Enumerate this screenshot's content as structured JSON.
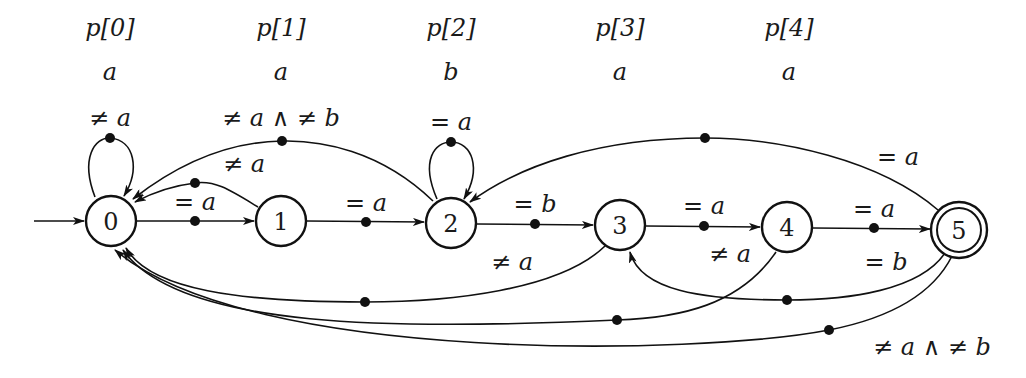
{
  "diagram": {
    "type": "finite-automaton (KMP pattern matcher)",
    "pattern_headers": [
      {
        "index_label": "p[0]",
        "char": "a",
        "x": 110
      },
      {
        "index_label": "p[1]",
        "char": "a",
        "x": 281
      },
      {
        "index_label": "p[2]",
        "char": "b",
        "x": 451
      },
      {
        "index_label": "p[3]",
        "char": "a",
        "x": 620
      },
      {
        "index_label": "p[4]",
        "char": "a",
        "x": 789
      }
    ],
    "states": [
      {
        "id": "0",
        "label": "0",
        "x": 111,
        "y": 221,
        "initial": true,
        "accepting": false
      },
      {
        "id": "1",
        "label": "1",
        "x": 281,
        "y": 221,
        "initial": false,
        "accepting": false
      },
      {
        "id": "2",
        "label": "2",
        "x": 451,
        "y": 223,
        "initial": false,
        "accepting": false
      },
      {
        "id": "3",
        "label": "3",
        "x": 620,
        "y": 225,
        "initial": false,
        "accepting": false
      },
      {
        "id": "4",
        "label": "4",
        "x": 787,
        "y": 227,
        "initial": false,
        "accepting": false
      },
      {
        "id": "5",
        "label": "5",
        "x": 959,
        "y": 230,
        "initial": false,
        "accepting": true
      }
    ],
    "transitions": [
      {
        "from": "0",
        "to": "0",
        "label": "≠ a"
      },
      {
        "from": "0",
        "to": "1",
        "label": "= a"
      },
      {
        "from": "1",
        "to": "0",
        "label": "≠ a"
      },
      {
        "from": "1",
        "to": "2",
        "label": "= a"
      },
      {
        "from": "2",
        "to": "0",
        "label": "≠ a ∧ ≠ b"
      },
      {
        "from": "2",
        "to": "2",
        "label": "= a"
      },
      {
        "from": "2",
        "to": "3",
        "label": "= b"
      },
      {
        "from": "3",
        "to": "0",
        "label": "≠ a"
      },
      {
        "from": "3",
        "to": "4",
        "label": "= a"
      },
      {
        "from": "4",
        "to": "0",
        "label": "≠ a"
      },
      {
        "from": "4",
        "to": "5",
        "label": "= a"
      },
      {
        "from": "5",
        "to": "2",
        "label": "= a"
      },
      {
        "from": "5",
        "to": "3",
        "label": "= b"
      },
      {
        "from": "5",
        "to": "0",
        "label": "≠ a ∧ ≠ b"
      }
    ]
  }
}
